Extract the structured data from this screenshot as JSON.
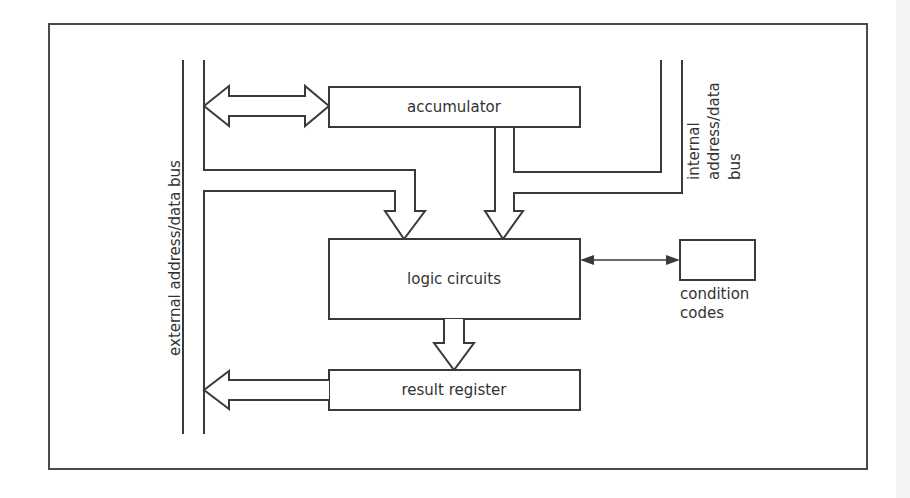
{
  "diagram": {
    "type": "block-diagram",
    "colors": {
      "line": "#3a3a3a",
      "text": "#333333",
      "background": "#ffffff"
    },
    "blocks": {
      "accumulator": {
        "label": "accumulator"
      },
      "logic": {
        "label": "logic circuits"
      },
      "result": {
        "label": "result register"
      },
      "condition": {
        "label_line1": "condition",
        "label_line2": "codes"
      }
    },
    "buses": {
      "external": {
        "label": "external address/data bus"
      },
      "internal": {
        "label_line1": "internal",
        "label_line2": "address/data",
        "label_line3": "bus"
      }
    },
    "connections": [
      {
        "from": "external bus",
        "to": "accumulator",
        "kind": "bidirectional wide arrow"
      },
      {
        "from": "external bus",
        "to": "logic circuits",
        "kind": "wide arrow"
      },
      {
        "from": "accumulator",
        "to": "logic circuits",
        "kind": "wide arrow (merged with internal bus)"
      },
      {
        "from": "internal bus",
        "to": "logic circuits",
        "kind": "wide arrow"
      },
      {
        "from": "logic circuits",
        "to": "condition codes",
        "kind": "bidirectional thin arrow"
      },
      {
        "from": "logic circuits",
        "to": "result register",
        "kind": "wide arrow"
      },
      {
        "from": "result register",
        "to": "external bus",
        "kind": "wide arrow"
      }
    ]
  }
}
